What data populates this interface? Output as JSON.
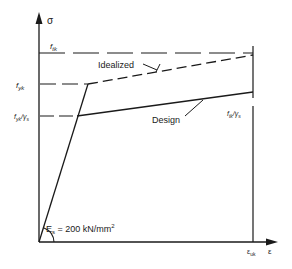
{
  "axes": {
    "y_label": "σ",
    "x_label": "ε",
    "x_mark": "ε",
    "x_mark_sub": "uk"
  },
  "levels": {
    "ftk": {
      "main": "f",
      "sub": "tk"
    },
    "fyk": {
      "main": "f",
      "sub": "yk"
    },
    "fyk_gs": {
      "main": "f",
      "sub": "yk",
      "div": "/γ",
      "div_sub": "s"
    },
    "ftk_gs": {
      "main": "f",
      "sub": "tk",
      "div": "/γ",
      "div_sub": "s"
    }
  },
  "curves": {
    "idealized": "Idealized",
    "design": "Design"
  },
  "modulus": {
    "main": "E",
    "sub": "s",
    "rest": " = 200 kN/mm",
    "sup": "2"
  },
  "colors": {
    "line": "#1a1a1a",
    "background": "#ffffff"
  }
}
